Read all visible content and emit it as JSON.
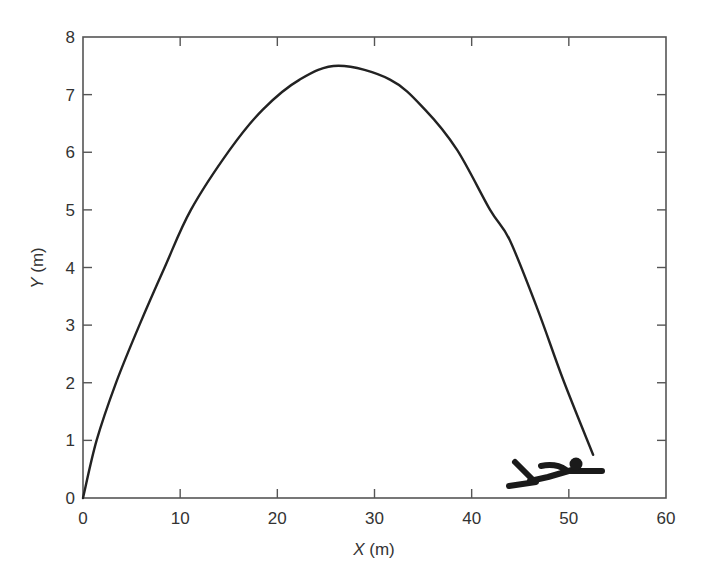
{
  "chart_data": {
    "type": "line",
    "title": "",
    "xlabel": "X (m)",
    "ylabel": "Y (m)",
    "xlabel_var": "X",
    "xlabel_unit": " (m)",
    "ylabel_var": "Y",
    "ylabel_unit": " (m)",
    "xlim": [
      0,
      60
    ],
    "ylim": [
      0,
      8
    ],
    "x_ticks": [
      0,
      10,
      20,
      30,
      40,
      50,
      60
    ],
    "y_ticks": [
      0,
      1,
      2,
      3,
      4,
      5,
      6,
      7,
      8
    ],
    "x_tick_labels": [
      "0",
      "10",
      "20",
      "30",
      "40",
      "50",
      "60"
    ],
    "y_tick_labels": [
      "0",
      "1",
      "2",
      "3",
      "4",
      "5",
      "6",
      "7",
      "8"
    ],
    "grid": false,
    "legend": null,
    "frame": "box with mirrored ticks on top and right",
    "series": [
      {
        "name": "trajectory",
        "color": "#222222",
        "x": [
          0,
          1.4,
          3.4,
          5.8,
          8.4,
          11.1,
          15.1,
          18.5,
          22.3,
          26.3,
          31.6,
          35.2,
          38.5,
          41.9,
          43.9,
          46.8,
          49.4,
          52.5
        ],
        "y": [
          0,
          1.0,
          2.0,
          3.0,
          4.0,
          5.0,
          6.04,
          6.74,
          7.26,
          7.5,
          7.26,
          6.74,
          6.04,
          5.0,
          4.48,
          3.27,
          2.06,
          0.75
        ]
      }
    ],
    "annotations": [
      {
        "type": "pictogram",
        "description": "stick figure of a person lying after a jump/landing",
        "x_range": [
          44,
          53.5
        ],
        "y_range": [
          0.2,
          0.65
        ]
      }
    ]
  },
  "colors": {
    "axis": "#555555",
    "curve": "#222222",
    "figure": "#1a1a1a",
    "text": "#333333",
    "background": "#ffffff"
  }
}
